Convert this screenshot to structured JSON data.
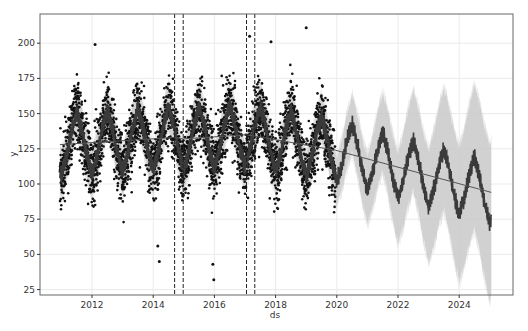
{
  "chart_data": {
    "type": "line",
    "title": "",
    "xlabel": "ds",
    "ylabel": "y",
    "x_range": [
      2010.7,
      2025.4
    ],
    "ylim": [
      22,
      222
    ],
    "grid": true,
    "legend": "none",
    "x_ticks": [
      "2012",
      "2014",
      "2016",
      "2018",
      "2020",
      "2022",
      "2024"
    ],
    "y_ticks": [
      "25",
      "50",
      "75",
      "100",
      "125",
      "150",
      "175",
      "200"
    ],
    "history_range": [
      2010.95,
      2019.95
    ],
    "forecast_range": [
      2019.95,
      2025.05
    ],
    "changepoints": [
      2014.7,
      2014.98,
      2017.05,
      2017.32
    ],
    "trend": {
      "x": [
        2010.95,
        2014.7,
        2014.98,
        2017.05,
        2017.32,
        2019.95,
        2025.05
      ],
      "y": [
        128,
        133,
        132,
        135,
        134,
        124,
        94
      ]
    },
    "seasonality": {
      "period_years": 1,
      "amplitude": 22,
      "peak_phase": 0.5,
      "trough_phase": 0.02
    },
    "uncertainty_band_halfwidth": 16,
    "forecast_uncertainty_growth_per_year": 3.5,
    "observed_points": {
      "count_approx": 3300,
      "range": [
        32,
        211
      ],
      "notable_outliers": [
        {
          "x": 2012.1,
          "y": 199
        },
        {
          "x": 2014.2,
          "y": 45
        },
        {
          "x": 2014.15,
          "y": 56
        },
        {
          "x": 2015.95,
          "y": 43
        },
        {
          "x": 2015.98,
          "y": 32
        },
        {
          "x": 2017.15,
          "y": 205
        },
        {
          "x": 2017.85,
          "y": 201
        },
        {
          "x": 2019.0,
          "y": 211
        }
      ]
    },
    "colors": {
      "points": "#111111",
      "forecast_line": "#3a3a3a",
      "band": "#c9c9c9",
      "trend": "#555555",
      "changepoints": "#222222",
      "grid": "#ebebeb",
      "frame": "#666666"
    }
  }
}
